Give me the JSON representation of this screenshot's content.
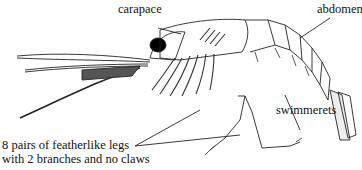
{
  "diagram": {
    "labels": {
      "carapace": "carapace",
      "abdomen": "abdomen",
      "swimmerets": "swimmerets",
      "legs_line1": "8 pairs of featherlike legs",
      "legs_line2": "with 2 branches and no claws"
    },
    "colors": {
      "ink": "#111111",
      "background": "#ffffff"
    }
  }
}
